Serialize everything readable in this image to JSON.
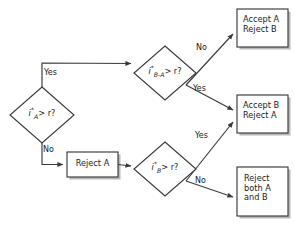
{
  "diagram": {
    "type": "flowchart",
    "colors": {
      "background": "#ffffff",
      "stroke": "#3a3a3a",
      "shadow": "#b9b9b9",
      "text": "#1a1a1a",
      "node_fill": "#ffffff"
    },
    "nodes": [
      {
        "id": "d1",
        "shape": "diamond",
        "label": "i*A > r?",
        "parts": {
          "base": "i",
          "star": "*",
          "sub": "A",
          "tail": "> r?"
        },
        "cx": 42,
        "cy": 115,
        "rx": 32,
        "ry": 28
      },
      {
        "id": "d2",
        "shape": "diamond",
        "label": "i*B-A > r?",
        "parts": {
          "base": "i",
          "star": "*",
          "sub": "B-A",
          "tail": "> r?"
        },
        "cx": 165,
        "cy": 73,
        "rx": 31,
        "ry": 27
      },
      {
        "id": "d3",
        "shape": "diamond",
        "label": "i*B > r?",
        "parts": {
          "base": "i",
          "star": "*",
          "sub": "B",
          "tail": "> r?"
        },
        "cx": 165,
        "cy": 169,
        "rx": 31,
        "ry": 27
      },
      {
        "id": "b_reject_a",
        "shape": "rect",
        "label": "Reject A",
        "lines": [
          "Reject A"
        ],
        "x": 67,
        "y": 152,
        "w": 51,
        "h": 25
      },
      {
        "id": "b_accept_a",
        "shape": "rect",
        "label": "Accept A Reject B",
        "lines": [
          "Accept A",
          "Reject B"
        ],
        "x": 237,
        "y": 9,
        "w": 51,
        "h": 38
      },
      {
        "id": "b_accept_b",
        "shape": "rect",
        "label": "Accept B Reject A",
        "lines": [
          "Accept B",
          "Reject A"
        ],
        "x": 237,
        "y": 95,
        "w": 51,
        "h": 38
      },
      {
        "id": "b_reject_both",
        "shape": "rect",
        "label": "Reject both A and B",
        "lines": [
          "Reject",
          "both A",
          "and B"
        ],
        "x": 237,
        "y": 167,
        "w": 51,
        "h": 49
      }
    ],
    "edges": [
      {
        "id": "e1",
        "from": "d1",
        "to": "d2",
        "label": "Yes",
        "label_x": 44,
        "label_y": 68
      },
      {
        "id": "e2",
        "from": "d1",
        "to": "b_reject_a",
        "label": "No",
        "label_x": 43,
        "label_y": 145
      },
      {
        "id": "e3",
        "from": "b_reject_a",
        "to": "d3",
        "label": "",
        "label_x": 0,
        "label_y": 0
      },
      {
        "id": "e4",
        "from": "d2",
        "to": "b_accept_a",
        "label": "No",
        "label_x": 196,
        "label_y": 43
      },
      {
        "id": "e5",
        "from": "d2",
        "to": "b_accept_b",
        "label": "Yes",
        "label_x": 193,
        "label_y": 84
      },
      {
        "id": "e6",
        "from": "d3",
        "to": "b_accept_b",
        "label": "Yes",
        "label_x": 195,
        "label_y": 131
      },
      {
        "id": "e7",
        "from": "d3",
        "to": "b_reject_both",
        "label": "No",
        "label_x": 195,
        "label_y": 176
      }
    ]
  }
}
